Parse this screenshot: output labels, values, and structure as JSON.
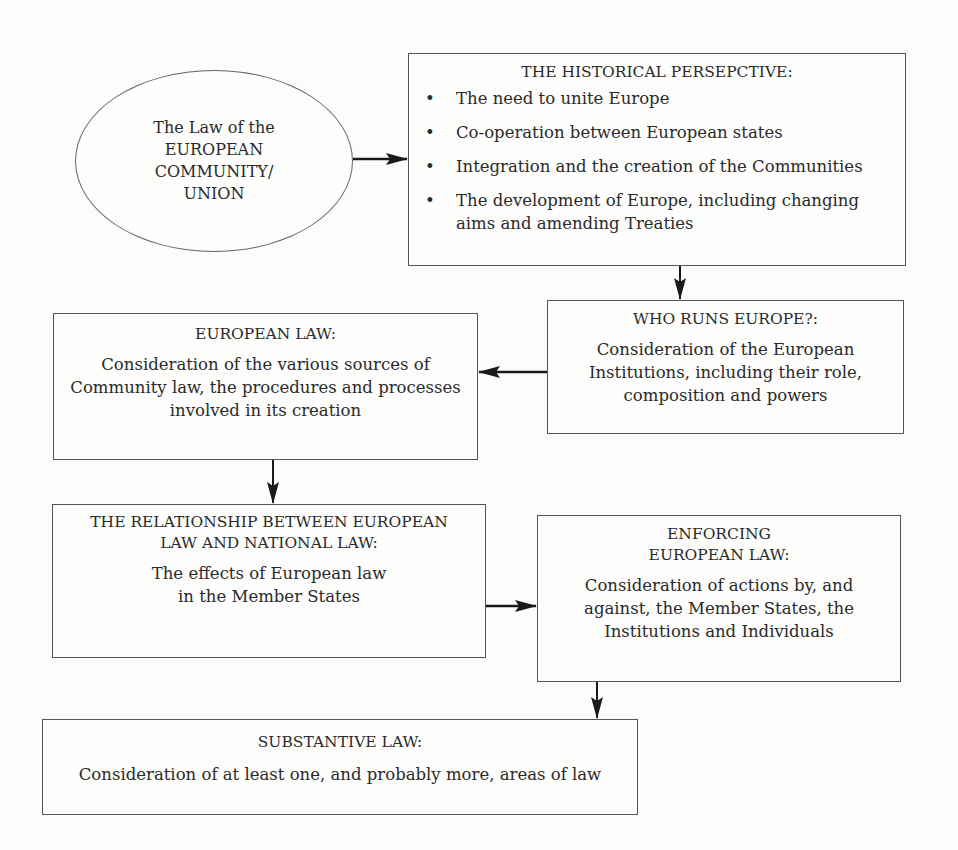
{
  "diagram": {
    "type": "flowchart",
    "start_node": {
      "text": "The Law of the\nEUROPEAN\nCOMMUNITY/\nUNION"
    },
    "historical": {
      "title": "THE HISTORICAL PERSEPCTIVE:",
      "bullets": [
        "The need to unite Europe",
        "Co-operation between European states",
        "Integration and the creation of the Communities",
        "The development of Europe, including changing aims and amending Treaties"
      ],
      "bullet_glyph": "•"
    },
    "who_runs": {
      "title": "WHO RUNS EUROPE?:",
      "body": "Consideration of the European\nInstitutions, including their role,\ncomposition and powers"
    },
    "european_law": {
      "title": "EUROPEAN LAW:",
      "body": "Consideration of the various sources of\nCommunity law, the procedures and processes\ninvolved in its creation"
    },
    "relationship": {
      "title": "THE RELATIONSHIP BETWEEN EUROPEAN\nLAW AND NATIONAL LAW:",
      "body": "The effects of European law\nin the Member States"
    },
    "enforcing": {
      "title": "ENFORCING\nEUROPEAN LAW:",
      "body": "Consideration of actions by, and\nagainst, the Member States, the\nInstitutions and Individuals"
    },
    "substantive": {
      "title": "SUBSTANTIVE LAW:",
      "body": "Consideration of at least one, and probably more, areas of law"
    },
    "edges": [
      {
        "from": "start_node",
        "to": "historical",
        "direction": "right"
      },
      {
        "from": "historical",
        "to": "who_runs",
        "direction": "down"
      },
      {
        "from": "who_runs",
        "to": "european_law",
        "direction": "left"
      },
      {
        "from": "european_law",
        "to": "relationship",
        "direction": "down"
      },
      {
        "from": "relationship",
        "to": "enforcing",
        "direction": "right"
      },
      {
        "from": "enforcing",
        "to": "substantive",
        "direction": "down"
      }
    ],
    "colors": {
      "line": "#555555",
      "arrow": "#1a1a1a",
      "text": "#2a2a2a",
      "background": "#fcfcfb"
    }
  }
}
